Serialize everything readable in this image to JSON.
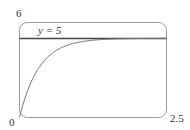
{
  "chart_data": {
    "type": "line",
    "title": "",
    "xlabel": "",
    "ylabel": "",
    "xlim": [
      0,
      2.5
    ],
    "ylim": [
      0,
      6
    ],
    "x_tick_labels": [
      "0",
      "2.5"
    ],
    "y_tick_labels": [
      "6"
    ],
    "grid": false,
    "series": [
      {
        "name": "y = 5(1 - e^(-3t))",
        "x": [
          0,
          0.1,
          0.2,
          0.3,
          0.5,
          0.75,
          1.0,
          1.5,
          2.0,
          2.5
        ],
        "values": [
          0,
          1.3,
          2.26,
          2.97,
          3.88,
          4.47,
          4.75,
          4.94,
          4.99,
          5.0
        ]
      },
      {
        "name": "y = 5",
        "x": [
          0,
          2.5
        ],
        "values": [
          5,
          5
        ]
      }
    ],
    "annotations": [
      {
        "text": "y = 5",
        "x": 0.55,
        "y": 5.5
      }
    ]
  },
  "labels": {
    "y_max": "6",
    "origin": "0",
    "x_max": "2.5",
    "asymptote": "y = 5"
  }
}
